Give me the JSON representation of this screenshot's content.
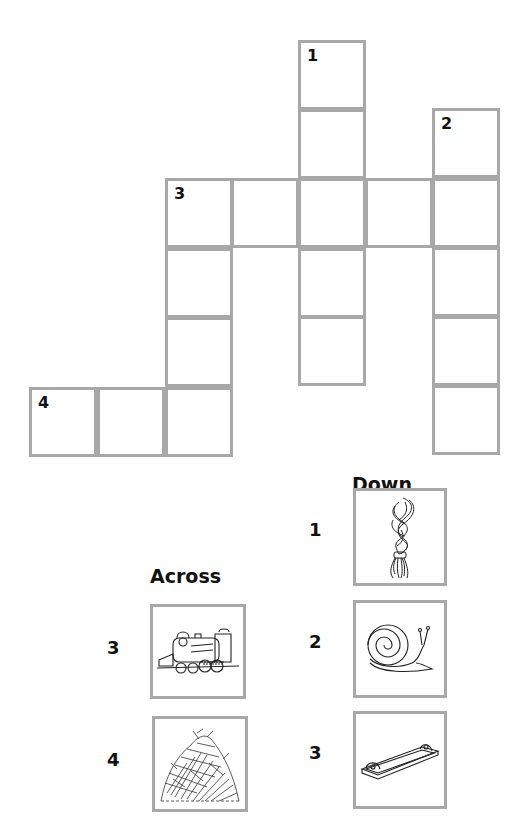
{
  "puzzle": {
    "grid": {
      "cells": [
        {
          "id": "r0c4",
          "x": 298,
          "y": 40,
          "number": "1"
        },
        {
          "id": "r1c4",
          "x": 298,
          "y": 109,
          "number": ""
        },
        {
          "id": "r1c6",
          "x": 432,
          "y": 108,
          "number": "2"
        },
        {
          "id": "r2c2",
          "x": 165,
          "y": 178,
          "number": "3"
        },
        {
          "id": "r2c3",
          "x": 231,
          "y": 178,
          "number": ""
        },
        {
          "id": "r2c4",
          "x": 298,
          "y": 178,
          "number": ""
        },
        {
          "id": "r2c5",
          "x": 365,
          "y": 178,
          "number": ""
        },
        {
          "id": "r2c6",
          "x": 432,
          "y": 178,
          "number": ""
        },
        {
          "id": "r3c2",
          "x": 165,
          "y": 248,
          "number": ""
        },
        {
          "id": "r3c4",
          "x": 298,
          "y": 248,
          "number": ""
        },
        {
          "id": "r3c6",
          "x": 432,
          "y": 247,
          "number": ""
        },
        {
          "id": "r4c2",
          "x": 165,
          "y": 317,
          "number": ""
        },
        {
          "id": "r4c4",
          "x": 298,
          "y": 316,
          "number": ""
        },
        {
          "id": "r4c6",
          "x": 432,
          "y": 316,
          "number": ""
        },
        {
          "id": "r5c0",
          "x": 29,
          "y": 387,
          "number": "4"
        },
        {
          "id": "r5c1",
          "x": 97,
          "y": 387,
          "number": ""
        },
        {
          "id": "r5c2",
          "x": 165,
          "y": 387,
          "number": ""
        },
        {
          "id": "r5c6",
          "x": 432,
          "y": 385,
          "number": ""
        }
      ]
    },
    "across": {
      "heading": "Across",
      "clues": [
        {
          "number": "3",
          "image": "steam-locomotive-icon"
        },
        {
          "number": "4",
          "image": "haystack-icon"
        }
      ]
    },
    "down": {
      "heading": "Down",
      "clues": [
        {
          "number": "1",
          "image": "braid-icon"
        },
        {
          "number": "2",
          "image": "snail-icon"
        },
        {
          "number": "3",
          "image": "tray-icon"
        }
      ]
    },
    "colors": {
      "border": "#a8a8a8",
      "text": "#111111",
      "background": "#ffffff"
    }
  }
}
